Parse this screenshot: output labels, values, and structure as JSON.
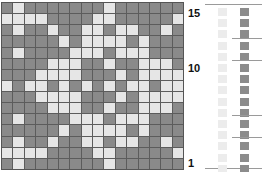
{
  "chart": {
    "columns": 16,
    "rows": 15,
    "colors": {
      "light": "#e6e6e6",
      "dark": "#8a8a8a",
      "grid_line": "#5c5c5c"
    },
    "grid_top_to_bottom": [
      "DLDDDDDDDLDDDDDD",
      "LLLLDDDDLLDDDDDL",
      "DLDDLDDLLDLLDDLD",
      "DDDDDLDLLLLDLDDD",
      "DLDDDDLLLDLLLDDD",
      "DDDDLLLDDLDDLLLD",
      "DDDLLLLDDDLDLLLL",
      "LDLLDLDLDLDLLDLL",
      "DDDLLLLDDDLDLLLL",
      "DDDDLLLDDLDDLLLD",
      "DLDDDDLLLDLLLDDD",
      "DDDDDLDLLLLDLDDD",
      "DLDDLDDLLDLLDDLD",
      "LLLLDDDDLLDDDDDL",
      "DLDDDDDDDLDDDDDD"
    ]
  },
  "row_labels": [
    {
      "text": "15",
      "row": 15
    },
    {
      "text": "10",
      "row": 10
    },
    {
      "text": "1",
      "row": 1
    }
  ],
  "legend": {
    "light_column_count": 15,
    "dark_column_count": 15,
    "divider_rows_y": [
      38,
      60,
      115,
      137
    ]
  }
}
